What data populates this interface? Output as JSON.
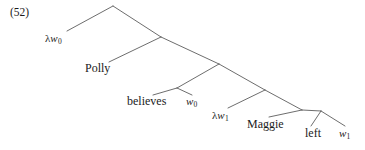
{
  "figure": {
    "example_number": "(52)",
    "type": "syntax-tree",
    "line_color": "#5c5c5c",
    "text_color": "#1b1b1b",
    "background_color": "#ffffff",
    "width": 365,
    "height": 150
  },
  "tree": {
    "leaves": [
      {
        "id": "lambda-w0",
        "kind": "lambda-binder",
        "lambda": "λ",
        "variable": "w",
        "subscript": "0",
        "text": "λw₀",
        "x": 45,
        "y": 33
      },
      {
        "id": "polly",
        "kind": "word",
        "text": "Polly",
        "x": 85,
        "y": 62
      },
      {
        "id": "believes",
        "kind": "word",
        "text": "believes",
        "x": 127,
        "y": 95
      },
      {
        "id": "w0-trace",
        "kind": "world-variable",
        "variable": "w",
        "subscript": "0",
        "text": "w₀",
        "x": 186,
        "y": 96
      },
      {
        "id": "lambda-w1",
        "kind": "lambda-binder",
        "lambda": "λ",
        "variable": "w",
        "subscript": "1",
        "text": "λw₁",
        "x": 212,
        "y": 110
      },
      {
        "id": "maggie",
        "kind": "word",
        "text": "Maggie",
        "x": 247,
        "y": 118
      },
      {
        "id": "left",
        "kind": "word",
        "text": "left",
        "x": 305,
        "y": 127
      },
      {
        "id": "w1-trace",
        "kind": "world-variable",
        "variable": "w",
        "subscript": "1",
        "text": "w₁",
        "x": 339,
        "y": 128
      }
    ],
    "branches": [
      {
        "id": "apex-left-to-lambda-w0",
        "x1": 113,
        "y1": 6,
        "x2": 67,
        "y2": 31
      },
      {
        "id": "apex-right-to-node2",
        "x1": 113,
        "y1": 6,
        "x2": 161,
        "y2": 37
      },
      {
        "id": "node2-left-to-polly",
        "x1": 161,
        "y1": 37,
        "x2": 109,
        "y2": 62
      },
      {
        "id": "node2-right-to-node3",
        "x1": 161,
        "y1": 37,
        "x2": 219,
        "y2": 64
      },
      {
        "id": "node3-left-to-node4",
        "x1": 219,
        "y1": 64,
        "x2": 177,
        "y2": 88
      },
      {
        "id": "node4-left-to-believes",
        "x1": 177,
        "y1": 88,
        "x2": 153,
        "y2": 95
      },
      {
        "id": "node4-right-to-w0",
        "x1": 177,
        "y1": 88,
        "x2": 192,
        "y2": 95
      },
      {
        "id": "node3-right-to-node5",
        "x1": 219,
        "y1": 64,
        "x2": 265,
        "y2": 90
      },
      {
        "id": "node5-left-to-lambda-w1",
        "x1": 265,
        "y1": 90,
        "x2": 228,
        "y2": 108
      },
      {
        "id": "node5-right-to-node6",
        "x1": 265,
        "y1": 90,
        "x2": 302,
        "y2": 110
      },
      {
        "id": "node6-left-to-maggie",
        "x1": 302,
        "y1": 110,
        "x2": 269,
        "y2": 117
      },
      {
        "id": "node6-right-to-node7",
        "x1": 302,
        "y1": 110,
        "x2": 321,
        "y2": 111
      },
      {
        "id": "node7-left-to-left",
        "x1": 321,
        "y1": 111,
        "x2": 311,
        "y2": 126
      },
      {
        "id": "node7-right-to-w1",
        "x1": 321,
        "y1": 111,
        "x2": 345,
        "y2": 126
      }
    ]
  }
}
